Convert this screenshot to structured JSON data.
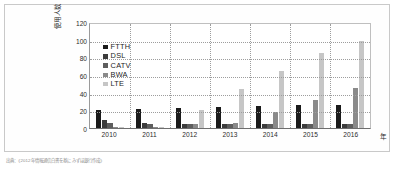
{
  "caption": "出典：《2012年情報通信白書を基にみずほ銀行作成》",
  "chart_data": {
    "type": "bar",
    "title": "",
    "subtitle": "",
    "xlabel": "年",
    "ylabel": "使用人数（百万）",
    "ylim": [
      0,
      120
    ],
    "ytick_labels": [
      "120",
      "100",
      "80",
      "60",
      "40",
      "20",
      "0"
    ],
    "ytick_values": [
      120,
      100,
      80,
      60,
      40,
      20,
      0
    ],
    "grid": true,
    "legend_position": "upper-left",
    "categories": [
      "2010",
      "2011",
      "2012",
      "2013",
      "2014",
      "2015",
      "2016"
    ],
    "series": [
      {
        "name": "FTTH",
        "color": "#1a1a1a",
        "values": [
          20,
          21.5,
          22.5,
          23.5,
          24.5,
          25.5,
          26.5
        ]
      },
      {
        "name": "DSL",
        "color": "#3c3c3c",
        "values": [
          9,
          6,
          5,
          5,
          4.5,
          4.5,
          4
        ]
      },
      {
        "name": "CATV",
        "color": "#5e5e5e",
        "values": [
          6,
          5,
          4,
          4,
          4,
          4,
          4
        ]
      },
      {
        "name": "BWA",
        "color": "#8a8a8a",
        "values": [
          1,
          1.5,
          4,
          6,
          18,
          32,
          45
        ]
      },
      {
        "name": "LTE",
        "color": "#c6c6c6",
        "values": [
          0,
          0.5,
          20,
          44,
          65,
          85,
          99
        ]
      }
    ]
  }
}
